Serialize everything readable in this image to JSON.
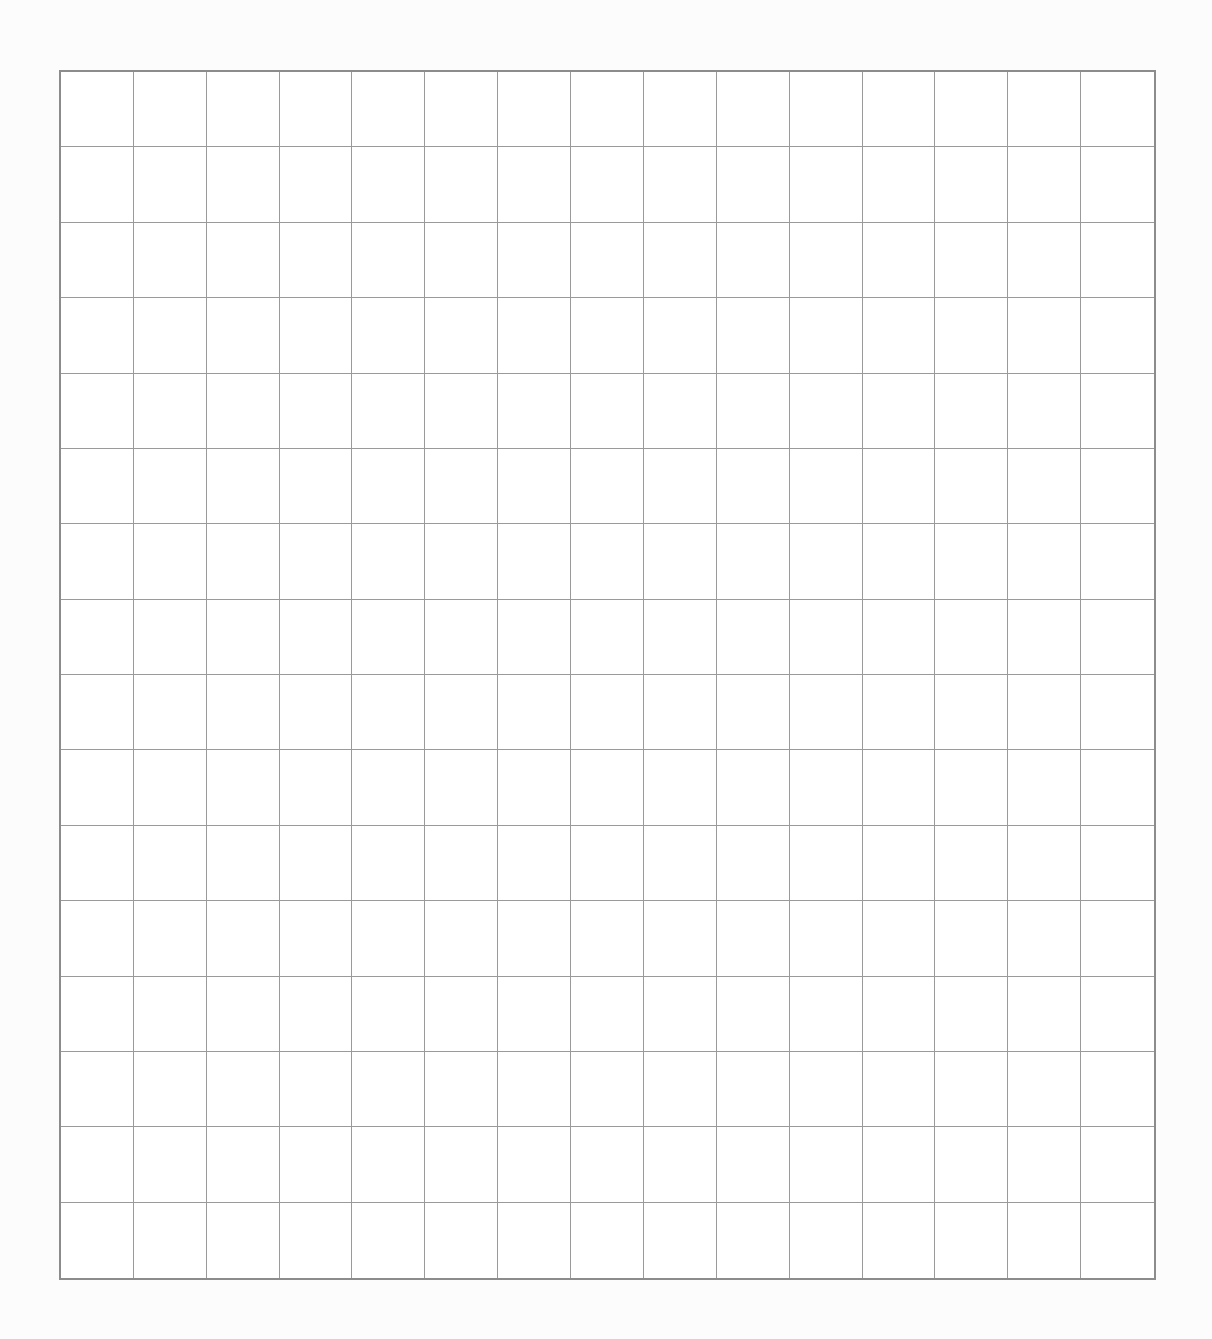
{
  "sheet": {
    "type": "blank-grid-paper",
    "columns": 15,
    "rows": 16,
    "colors": {
      "background": "#fcfcfc",
      "border": "#8c8c8c",
      "gridline": "#9a9a9a"
    }
  }
}
